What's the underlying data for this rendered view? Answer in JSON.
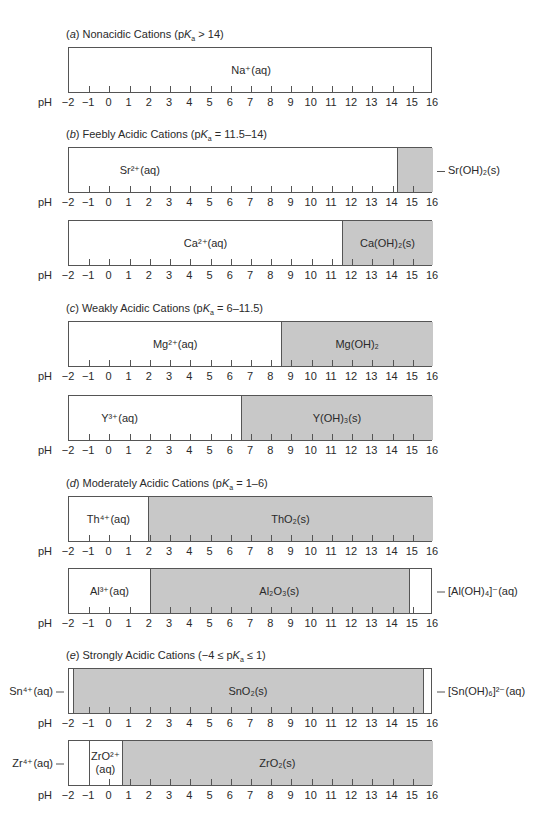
{
  "chart_data": {
    "type": "bar",
    "xlabel": "pH",
    "xlim": [
      -2,
      16
    ],
    "ticks": [
      -2,
      -1,
      0,
      1,
      2,
      3,
      4,
      5,
      6,
      7,
      8,
      9,
      10,
      11,
      12,
      13,
      14,
      15,
      16
    ],
    "sections": [
      {
        "id": "a",
        "title_prefix": "(",
        "title_letter": "a",
        "title_text": ") Nonacidic Cations (pK",
        "title_sub": "a",
        "title_suffix": " > 14)",
        "bars": [
          {
            "cation": "Na+",
            "top": 47,
            "segments": [
              {
                "from": -2,
                "to": 16,
                "label": "Na⁺(aq)",
                "fill": "white"
              }
            ],
            "axis_pH_label": true
          }
        ]
      },
      {
        "id": "b",
        "title_prefix": "(",
        "title_letter": "b",
        "title_text": ") Feebly Acidic Cations (pK",
        "title_sub": "a",
        "title_suffix": " = 11.5–14)",
        "bars": [
          {
            "cation": "Sr2+",
            "top": 147,
            "segments": [
              {
                "from": -2,
                "to": 14.2,
                "label": "Sr²⁺(aq)",
                "fill": "white",
                "label_x": 1.5
              },
              {
                "from": 14.2,
                "to": 16,
                "label": "",
                "fill": "grey"
              }
            ],
            "right_label": "Sr(OH)₂(s)",
            "axis_pH_label": true
          },
          {
            "cation": "Ca2+",
            "top": 220,
            "segments": [
              {
                "from": -2,
                "to": 11.5,
                "label": "Ca²⁺(aq)",
                "fill": "white"
              },
              {
                "from": 11.5,
                "to": 16,
                "label": "Ca(OH)₂(s)",
                "fill": "grey"
              }
            ],
            "axis_pH_label": true
          }
        ]
      },
      {
        "id": "c",
        "title_prefix": "(",
        "title_letter": "c",
        "title_text": ") Weakly Acidic Cations (pK",
        "title_sub": "a",
        "title_suffix": " = 6–11.5)",
        "bars": [
          {
            "cation": "Mg2+",
            "top": 321,
            "segments": [
              {
                "from": -2,
                "to": 8.5,
                "label": "Mg²⁺(aq)",
                "fill": "white"
              },
              {
                "from": 8.5,
                "to": 16,
                "label": "Mg(OH)₂",
                "fill": "grey"
              }
            ],
            "axis_pH_label": true
          },
          {
            "cation": "Y3+",
            "top": 395,
            "segments": [
              {
                "from": -2,
                "to": 6.5,
                "label": "Y³⁺(aq)",
                "fill": "white",
                "label_x": 0.5
              },
              {
                "from": 6.5,
                "to": 16,
                "label": "Y(OH)₃(s)",
                "fill": "grey"
              }
            ],
            "axis_pH_label": true
          }
        ]
      },
      {
        "id": "d",
        "title_prefix": "(",
        "title_letter": "d",
        "title_text": ") Moderately Acidic Cations (pK",
        "title_sub": "a",
        "title_suffix": " = 1–6)",
        "bars": [
          {
            "cation": "Th4+",
            "top": 496,
            "segments": [
              {
                "from": -2,
                "to": 1.9,
                "label": "Th⁴⁺(aq)",
                "fill": "white"
              },
              {
                "from": 1.9,
                "to": 16,
                "label": "ThO₂(s)",
                "fill": "grey"
              }
            ],
            "axis_pH_label": true
          },
          {
            "cation": "Al3+",
            "top": 568,
            "segments": [
              {
                "from": -2,
                "to": 2,
                "label": "Al³⁺(aq)",
                "fill": "white"
              },
              {
                "from": 2,
                "to": 14.8,
                "label": "Al₂O₃(s)",
                "fill": "grey"
              },
              {
                "from": 14.8,
                "to": 16,
                "label": "",
                "fill": "white"
              }
            ],
            "right_label": "[Al(OH)₄]⁻(aq)",
            "axis_pH_label": true
          }
        ]
      },
      {
        "id": "e",
        "title_prefix": "(",
        "title_letter": "e",
        "title_text": ") Strongly Acidic Cations (−4 ≤ pK",
        "title_sub": "a",
        "title_suffix": " ≤ 1)",
        "bars": [
          {
            "cation": "Sn4+",
            "top": 668,
            "segments": [
              {
                "from": -2,
                "to": -1.8,
                "label": "",
                "fill": "white"
              },
              {
                "from": -1.8,
                "to": 15.5,
                "label": "SnO₂(s)",
                "fill": "grey"
              },
              {
                "from": 15.5,
                "to": 16,
                "label": "",
                "fill": "white"
              }
            ],
            "left_label": "Sn⁴⁺(aq)",
            "right_label": "[Sn(OH)₆]²⁻(aq)",
            "axis_pH_label": true
          },
          {
            "cation": "Zr4+",
            "top": 740,
            "segments": [
              {
                "from": -2,
                "to": -1,
                "label": "",
                "fill": "white"
              },
              {
                "from": -1,
                "to": 0.6,
                "label": "ZrO²⁺\n(aq)",
                "fill": "white"
              },
              {
                "from": 0.6,
                "to": 16,
                "label": "ZrO₂(s)",
                "fill": "grey"
              }
            ],
            "left_label": "Zr⁴⁺(aq)",
            "axis_pH_label": true
          }
        ]
      }
    ]
  },
  "axis": {
    "ph_label": "pH"
  },
  "titles": {
    "a": {
      "letter": "a",
      "text": "Nonacidic Cations (p",
      "k": "K",
      "sub": "a",
      "rest": " > 14)"
    },
    "b": {
      "letter": "b",
      "text": "Feebly Acidic Cations (p",
      "k": "K",
      "sub": "a",
      "rest": " = 11.5–14)"
    },
    "c": {
      "letter": "c",
      "text": "Weakly Acidic Cations (p",
      "k": "K",
      "sub": "a",
      "rest": " = 6–11.5)"
    },
    "d": {
      "letter": "d",
      "text": "Moderately Acidic Cations (p",
      "k": "K",
      "sub": "a",
      "rest": " = 1–6)"
    },
    "e": {
      "letter": "e",
      "text": "Strongly Acidic Cations (−4 ≤ p",
      "k": "K",
      "sub": "a",
      "rest": " ≤ 1)"
    }
  },
  "colors": {
    "solid_fill": "#c8c8c8",
    "aqueous_fill": "#ffffff",
    "border": "#555555"
  }
}
